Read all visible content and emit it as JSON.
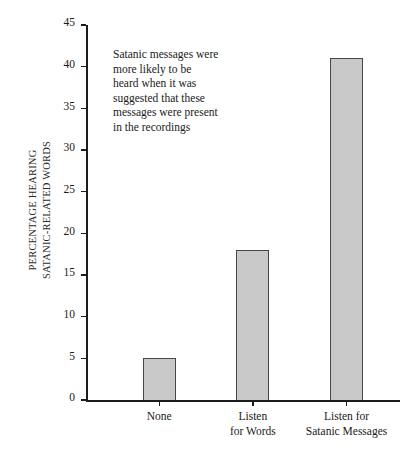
{
  "chart_data": {
    "type": "bar",
    "title": "",
    "xlabel": "",
    "ylabel_lines": [
      "PERCENTAGE HEARING",
      "SATANIC-RELATED WORDS"
    ],
    "ylabel": "PERCENTAGE HEARING SATANIC-RELATED WORDS",
    "categories": [
      "None",
      "Listen for Words",
      "Listen for Satanic Messages"
    ],
    "category_label_lines": [
      [
        "None"
      ],
      [
        "Listen",
        "for Words"
      ],
      [
        "Listen for",
        "Satanic Messages"
      ]
    ],
    "values": [
      5,
      18,
      41
    ],
    "ylim": [
      0,
      45
    ],
    "ytick_values": [
      0,
      5,
      10,
      15,
      20,
      25,
      30,
      35,
      40,
      45
    ],
    "ytick_labels": [
      "0",
      "5",
      "10",
      "15",
      "20",
      "25",
      "30",
      "35",
      "40",
      "45"
    ],
    "grid": false,
    "legend": null,
    "annotations": [
      {
        "lines": [
          "Satanic messages were",
          "more likely to be",
          "heard when it was",
          "suggested that these",
          "messages were present",
          "in the recordings"
        ]
      }
    ],
    "colors": {
      "bar_fill": "#c9c9c9",
      "bar_edge": "#474747",
      "axis": "#1c1c1c",
      "text": "#1a1a1a",
      "background": "#ffffff"
    }
  }
}
